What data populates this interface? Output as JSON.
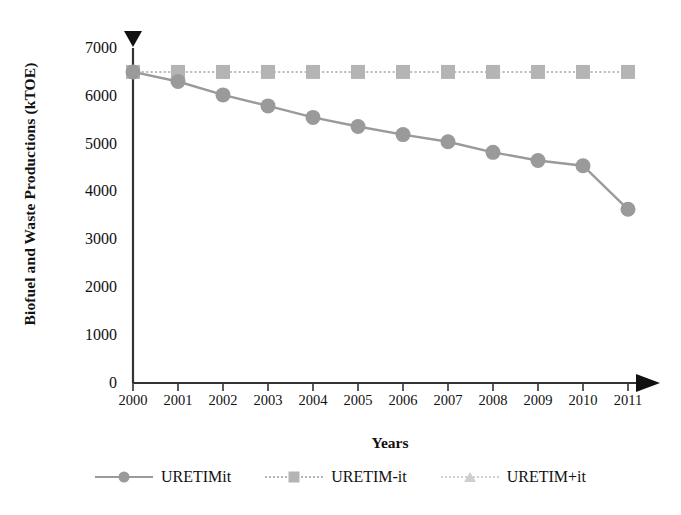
{
  "chart_data": {
    "type": "line",
    "title": "",
    "xlabel": "Years",
    "ylabel": "Biofuel and Waste Productions (kTOE)",
    "categories": [
      "2000",
      "2001",
      "2002",
      "2003",
      "2004",
      "2005",
      "2006",
      "2007",
      "2008",
      "2009",
      "2010",
      "2011"
    ],
    "ylim": [
      0,
      7000
    ],
    "yticks": [
      0,
      1000,
      2000,
      3000,
      4000,
      5000,
      6000,
      7000
    ],
    "ytick_labels": [
      "0",
      "1000",
      "2000",
      "3000",
      "4000",
      "5000",
      "6000",
      "7000"
    ],
    "grid": false,
    "legend_position": "bottom",
    "series": [
      {
        "name": "URETIMit",
        "marker": "circle",
        "line_style": "solid",
        "color": "#9a9a9a",
        "values": [
          6500,
          6300,
          6020,
          5790,
          5550,
          5360,
          5190,
          5040,
          4820,
          4650,
          4540,
          3630
        ]
      },
      {
        "name": "URETIM-it",
        "marker": "square",
        "line_style": "dotted",
        "color": "#b4b4b4",
        "values": [
          6500,
          6500,
          6500,
          6500,
          6500,
          6500,
          6500,
          6500,
          6500,
          6500,
          6500,
          6500
        ]
      },
      {
        "name": "URETIM+it",
        "marker": "triangle",
        "line_style": "dotted",
        "color": "#cfcfcf",
        "values": [
          6500,
          6500,
          6500,
          6500,
          6500,
          6500,
          6500,
          6500,
          6500,
          6500,
          6500,
          6500
        ]
      }
    ]
  },
  "axes": {
    "y_title": "Biofuel and Waste Productions (kTOE)",
    "x_title": "Years",
    "y_tick_0": "0",
    "y_tick_1": "1000",
    "y_tick_2": "2000",
    "y_tick_3": "3000",
    "y_tick_4": "4000",
    "y_tick_5": "5000",
    "y_tick_6": "6000",
    "y_tick_7": "7000",
    "x_tick_0": "2000",
    "x_tick_1": "2001",
    "x_tick_2": "2002",
    "x_tick_3": "2003",
    "x_tick_4": "2004",
    "x_tick_5": "2005",
    "x_tick_6": "2006",
    "x_tick_7": "2007",
    "x_tick_8": "2008",
    "x_tick_9": "2009",
    "x_tick_10": "2010",
    "x_tick_11": "2011"
  },
  "legend": {
    "items": [
      {
        "label": "URETIMit",
        "marker": "circle-marker",
        "color": "#9a9a9a"
      },
      {
        "label": "URETIM-it",
        "marker": "square-marker",
        "color": "#b4b4b4"
      },
      {
        "label": "URETIM+it",
        "marker": "triangle-marker",
        "color": "#cfcfcf"
      }
    ]
  },
  "colors": {
    "axis": "#333333",
    "series1": "#9a9a9a",
    "series2": "#b4b4b4",
    "series3": "#cfcfcf",
    "text": "#111111"
  }
}
